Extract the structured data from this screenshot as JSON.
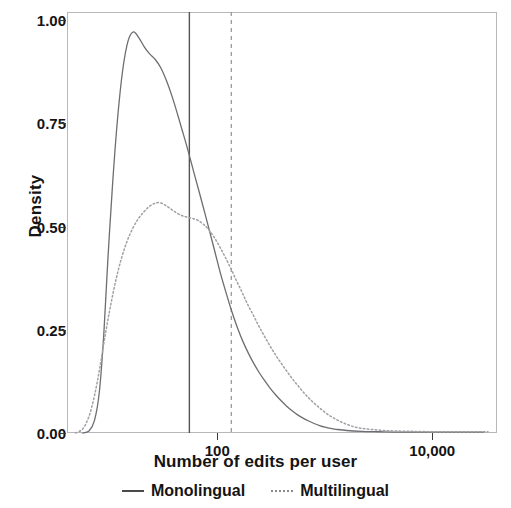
{
  "chart_data": {
    "type": "line",
    "title": "",
    "xlabel": "Number of edits per user",
    "ylabel": "Density",
    "xscale": "log10",
    "xlim": [
      4,
      40000
    ],
    "ylim": [
      0.0,
      1.02
    ],
    "grid": false,
    "legend_position": "bottom",
    "x_ticks": [
      {
        "value": 100,
        "label": "100"
      },
      {
        "value": 10000,
        "label": "10,000"
      }
    ],
    "y_ticks": [
      {
        "value": 0.0,
        "label": "0.00"
      },
      {
        "value": 0.25,
        "label": "0.25"
      },
      {
        "value": 0.5,
        "label": "0.50"
      },
      {
        "value": 0.75,
        "label": "0.75"
      },
      {
        "value": 1.0,
        "label": "1.00"
      }
    ],
    "annotations": [
      {
        "name": "monolingual-mean-line",
        "type": "vline",
        "style": "solid",
        "x": 55,
        "color": "#555555"
      },
      {
        "name": "multilingual-mean-line",
        "type": "vline",
        "style": "dashed",
        "x": 135,
        "color": "#9a9a9a"
      }
    ],
    "series": [
      {
        "name": "Monolingual",
        "style": "solid",
        "color": "#6d6d72",
        "points": [
          [
            5.6,
            0.0
          ],
          [
            6.4,
            0.005
          ],
          [
            7.2,
            0.03
          ],
          [
            8.0,
            0.1
          ],
          [
            8.8,
            0.24
          ],
          [
            9.6,
            0.42
          ],
          [
            10.6,
            0.6
          ],
          [
            11.8,
            0.76
          ],
          [
            13.2,
            0.88
          ],
          [
            14.8,
            0.95
          ],
          [
            16.6,
            0.972
          ],
          [
            18.6,
            0.958
          ],
          [
            21.0,
            0.935
          ],
          [
            23.6,
            0.918
          ],
          [
            26.5,
            0.905
          ],
          [
            29.8,
            0.885
          ],
          [
            33.5,
            0.855
          ],
          [
            37.7,
            0.818
          ],
          [
            42.4,
            0.775
          ],
          [
            47.6,
            0.73
          ],
          [
            53.6,
            0.683
          ],
          [
            60.2,
            0.634
          ],
          [
            67.7,
            0.585
          ],
          [
            76.2,
            0.535
          ],
          [
            85.6,
            0.485
          ],
          [
            96.3,
            0.433
          ],
          [
            108,
            0.383
          ],
          [
            122,
            0.336
          ],
          [
            137,
            0.293
          ],
          [
            154,
            0.255
          ],
          [
            173,
            0.222
          ],
          [
            195,
            0.193
          ],
          [
            219,
            0.168
          ],
          [
            246,
            0.146
          ],
          [
            277,
            0.126
          ],
          [
            311,
            0.108
          ],
          [
            350,
            0.092
          ],
          [
            393,
            0.078
          ],
          [
            442,
            0.065
          ],
          [
            497,
            0.054
          ],
          [
            559,
            0.044
          ],
          [
            628,
            0.036
          ],
          [
            707,
            0.029
          ],
          [
            795,
            0.023
          ],
          [
            894,
            0.018
          ],
          [
            1005,
            0.014
          ],
          [
            1130,
            0.011
          ],
          [
            1270,
            0.009
          ],
          [
            1600,
            0.006
          ],
          [
            2200,
            0.004
          ],
          [
            3200,
            0.003
          ],
          [
            5000,
            0.002
          ],
          [
            9000,
            0.002
          ],
          [
            16000,
            0.002
          ],
          [
            30000,
            0.002
          ]
        ]
      },
      {
        "name": "Multilingual",
        "style": "dotted",
        "color": "#a0a0a5",
        "points": [
          [
            4.8,
            0.0
          ],
          [
            5.6,
            0.01
          ],
          [
            6.4,
            0.04
          ],
          [
            7.2,
            0.09
          ],
          [
            8.1,
            0.16
          ],
          [
            9.1,
            0.24
          ],
          [
            10.2,
            0.31
          ],
          [
            11.5,
            0.375
          ],
          [
            12.9,
            0.425
          ],
          [
            14.5,
            0.465
          ],
          [
            16.3,
            0.495
          ],
          [
            18.3,
            0.518
          ],
          [
            20.6,
            0.535
          ],
          [
            23.1,
            0.548
          ],
          [
            26.0,
            0.556
          ],
          [
            29.2,
            0.558
          ],
          [
            32.8,
            0.552
          ],
          [
            36.9,
            0.543
          ],
          [
            41.4,
            0.534
          ],
          [
            46.6,
            0.527
          ],
          [
            52.3,
            0.523
          ],
          [
            58.8,
            0.52
          ],
          [
            66.1,
            0.515
          ],
          [
            74.2,
            0.506
          ],
          [
            83.4,
            0.492
          ],
          [
            93.7,
            0.474
          ],
          [
            105,
            0.452
          ],
          [
            118,
            0.427
          ],
          [
            133,
            0.4
          ],
          [
            149,
            0.372
          ],
          [
            168,
            0.344
          ],
          [
            188,
            0.316
          ],
          [
            212,
            0.29
          ],
          [
            238,
            0.264
          ],
          [
            267,
            0.24
          ],
          [
            300,
            0.217
          ],
          [
            337,
            0.195
          ],
          [
            379,
            0.175
          ],
          [
            426,
            0.156
          ],
          [
            478,
            0.138
          ],
          [
            537,
            0.121
          ],
          [
            604,
            0.105
          ],
          [
            678,
            0.09
          ],
          [
            762,
            0.077
          ],
          [
            856,
            0.065
          ],
          [
            962,
            0.054
          ],
          [
            1080,
            0.044
          ],
          [
            1214,
            0.036
          ],
          [
            1364,
            0.029
          ],
          [
            1532,
            0.023
          ],
          [
            1721,
            0.018
          ],
          [
            1934,
            0.014
          ],
          [
            2400,
            0.01
          ],
          [
            3200,
            0.007
          ],
          [
            4400,
            0.005
          ],
          [
            6500,
            0.004
          ],
          [
            11000,
            0.003
          ],
          [
            20000,
            0.003
          ],
          [
            33000,
            0.003
          ]
        ]
      }
    ]
  },
  "legend": {
    "items": [
      {
        "label": "Monolingual",
        "style": "solid"
      },
      {
        "label": "Multilingual",
        "style": "dotted"
      }
    ]
  }
}
